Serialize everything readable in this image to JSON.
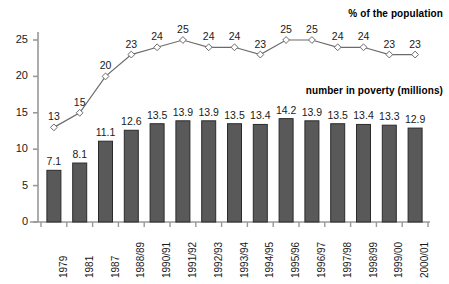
{
  "chart_data": {
    "type": "bar",
    "title": "",
    "xlabel": "",
    "ylabel": "",
    "ylim": [
      0,
      27
    ],
    "grid": false,
    "legend_position": "inside-top-right",
    "categories": [
      "1979",
      "1981",
      "1987",
      "1988/89",
      "1990/91",
      "1991/92",
      "1992/93",
      "1993/94",
      "1994/95",
      "1995/96",
      "1996/97",
      "1997/98",
      "1998/99",
      "1999/00",
      "2000/01"
    ],
    "yticks": [
      "0",
      "5",
      "10",
      "15",
      "20",
      "25"
    ],
    "ytick_values": [
      0,
      5,
      10,
      15,
      20,
      25
    ],
    "series": [
      {
        "name": "number in poverty (millions)",
        "type": "bar",
        "values": [
          7.1,
          8.1,
          11.1,
          12.6,
          13.5,
          13.9,
          13.9,
          13.5,
          13.4,
          14.2,
          13.9,
          13.5,
          13.4,
          13.3,
          12.9
        ],
        "labels": [
          "7.1",
          "8.1",
          "11.1",
          "12.6",
          "13.5",
          "13.9",
          "13.9",
          "13.5",
          "13.4",
          "14.2",
          "13.9",
          "13.5",
          "13.4",
          "13.3",
          "12.9"
        ],
        "color": "#595959",
        "edge_color": "#2b2b2b"
      },
      {
        "name": "% of the population",
        "type": "line",
        "values": [
          13,
          15,
          20,
          23,
          24,
          25,
          24,
          24,
          23,
          25,
          25,
          24,
          24,
          23,
          23
        ],
        "labels": [
          "13",
          "15",
          "20",
          "23",
          "24",
          "25",
          "24",
          "24",
          "23",
          "25",
          "25",
          "24",
          "24",
          "23",
          "23"
        ],
        "color": "#6b6b6b",
        "marker": "diamond",
        "marker_fill": "#ffffff"
      }
    ]
  },
  "legend": {
    "percent_label": "% of the population",
    "number_label": "number in poverty (millions)"
  },
  "colors": {
    "bar_fill": "#595959",
    "bar_edge": "#2b2b2b",
    "line": "#6b6b6b",
    "axis": "#999999",
    "text": "#1a1a1a",
    "background": "#ffffff"
  }
}
